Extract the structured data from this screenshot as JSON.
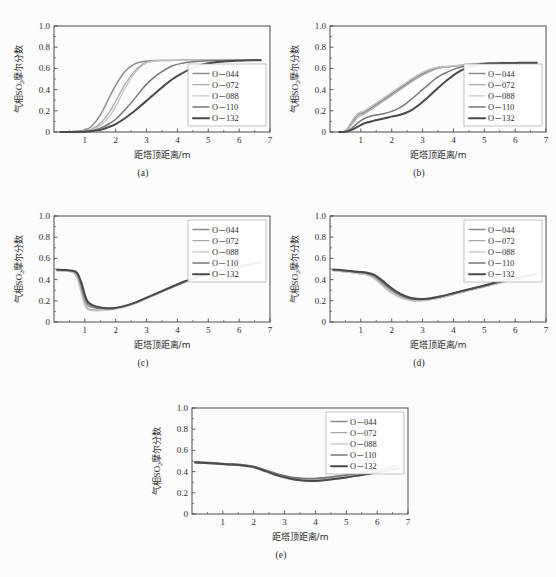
{
  "figure": {
    "background": "#fcfcfc",
    "axis_color": "#3a3a3a",
    "panels_count": 5
  },
  "axis": {
    "xlabel": "距塔顶距离/m",
    "ylabel_cjk_head": "气相",
    "ylabel_so2": "SO",
    "ylabel_sub": "2",
    "ylabel_cjk_tail": "摩尔分数",
    "ylabel_full": "气相SO2摩尔分数",
    "xticks": [
      "1",
      "2",
      "3",
      "4",
      "5",
      "6",
      "7"
    ],
    "yticks": [
      "0",
      "0.2",
      "0.4",
      "0.6",
      "0.8",
      "1.0"
    ],
    "xlim": [
      0,
      7
    ],
    "ylim": [
      0,
      1
    ]
  },
  "legend": {
    "entries": [
      {
        "label": "O－044",
        "color": "#8c8c8c",
        "width": 1.5
      },
      {
        "label": "O－072",
        "color": "#a8a8a8",
        "width": 1.3
      },
      {
        "label": "O－088",
        "color": "#c4c4c4",
        "width": 1.3
      },
      {
        "label": "O－110",
        "color": "#787878",
        "width": 1.5
      },
      {
        "label": "O－132",
        "color": "#4a4a4a",
        "width": 2.0
      }
    ]
  },
  "panels": [
    {
      "id": "a",
      "caption": "(a)",
      "legend_position": "bottom-right"
    },
    {
      "id": "b",
      "caption": "(b)",
      "legend_position": "bottom-right"
    },
    {
      "id": "c",
      "caption": "(c)",
      "legend_position": "top-right"
    },
    {
      "id": "d",
      "caption": "(d)",
      "legend_position": "top-right"
    },
    {
      "id": "e",
      "caption": "(e)",
      "legend_position": "top-right"
    }
  ],
  "chart_data": [
    {
      "type": "line",
      "panel": "a",
      "title": "(a)",
      "xlabel": "距塔顶距离/m",
      "ylabel": "气相SO2摩尔分数",
      "xlim": [
        0,
        7
      ],
      "ylim": [
        0,
        1
      ],
      "grid": false,
      "legend_position": "bottom-right",
      "x": [
        0.2,
        0.5,
        0.8,
        1.0,
        1.2,
        1.5,
        1.8,
        2.0,
        2.3,
        2.6,
        2.9,
        3.1,
        3.3,
        3.5,
        3.8,
        4.1,
        4.5,
        5.0,
        5.5,
        6.0,
        6.4,
        6.7
      ],
      "series": [
        {
          "name": "O－044",
          "values": [
            0.0,
            0.0,
            0.01,
            0.02,
            0.05,
            0.16,
            0.33,
            0.44,
            0.57,
            0.64,
            0.665,
            0.67,
            0.675,
            0.675,
            0.675,
            0.678,
            0.678,
            0.678,
            0.678,
            0.678,
            0.678,
            0.678
          ]
        },
        {
          "name": "O－072",
          "values": [
            0.0,
            0.0,
            0.005,
            0.01,
            0.025,
            0.08,
            0.19,
            0.29,
            0.45,
            0.57,
            0.645,
            0.665,
            0.672,
            0.675,
            0.675,
            0.676,
            0.677,
            0.678,
            0.678,
            0.678,
            0.678,
            0.678
          ]
        },
        {
          "name": "O－088",
          "values": [
            0.0,
            0.0,
            0.004,
            0.008,
            0.02,
            0.06,
            0.15,
            0.24,
            0.41,
            0.55,
            0.635,
            0.66,
            0.671,
            0.675,
            0.675,
            0.676,
            0.677,
            0.678,
            0.678,
            0.678,
            0.678,
            0.678
          ]
        },
        {
          "name": "O－110",
          "values": [
            0.0,
            0.0,
            0.002,
            0.005,
            0.012,
            0.035,
            0.08,
            0.12,
            0.21,
            0.31,
            0.42,
            0.48,
            0.53,
            0.57,
            0.62,
            0.645,
            0.662,
            0.672,
            0.675,
            0.677,
            0.678,
            0.678
          ]
        },
        {
          "name": "O－132",
          "values": [
            0.0,
            0.0,
            0.001,
            0.003,
            0.008,
            0.02,
            0.05,
            0.075,
            0.13,
            0.195,
            0.27,
            0.32,
            0.37,
            0.42,
            0.49,
            0.545,
            0.605,
            0.648,
            0.665,
            0.673,
            0.677,
            0.678
          ]
        }
      ]
    },
    {
      "type": "line",
      "panel": "b",
      "title": "(b)",
      "xlabel": "距塔顶距离/m",
      "ylabel": "气相SO2摩尔分数",
      "xlim": [
        0,
        7
      ],
      "ylim": [
        0,
        1
      ],
      "grid": false,
      "legend_position": "bottom-right",
      "x": [
        0.3,
        0.5,
        0.7,
        0.9,
        1.1,
        1.4,
        1.7,
        2.0,
        2.3,
        2.6,
        2.9,
        3.2,
        3.5,
        3.8,
        4.1,
        4.4,
        4.8,
        5.2,
        5.6,
        6.0,
        6.4,
        6.7
      ],
      "series": [
        {
          "name": "O－044",
          "values": [
            0.0,
            0.01,
            0.09,
            0.16,
            0.185,
            0.24,
            0.3,
            0.36,
            0.42,
            0.48,
            0.535,
            0.575,
            0.605,
            0.615,
            0.625,
            0.635,
            0.645,
            0.65,
            0.652,
            0.653,
            0.653,
            0.653
          ]
        },
        {
          "name": "O－072",
          "values": [
            0.0,
            0.008,
            0.07,
            0.14,
            0.17,
            0.225,
            0.285,
            0.345,
            0.405,
            0.465,
            0.52,
            0.565,
            0.6,
            0.613,
            0.623,
            0.633,
            0.644,
            0.649,
            0.651,
            0.652,
            0.653,
            0.653
          ]
        },
        {
          "name": "O－088",
          "values": [
            0.0,
            0.012,
            0.1,
            0.175,
            0.2,
            0.255,
            0.315,
            0.375,
            0.435,
            0.495,
            0.55,
            0.59,
            0.615,
            0.62,
            0.628,
            0.637,
            0.646,
            0.65,
            0.652,
            0.653,
            0.653,
            0.653
          ]
        },
        {
          "name": "O－110",
          "values": [
            0.0,
            0.004,
            0.035,
            0.085,
            0.125,
            0.155,
            0.17,
            0.195,
            0.235,
            0.3,
            0.375,
            0.45,
            0.52,
            0.565,
            0.6,
            0.622,
            0.64,
            0.648,
            0.651,
            0.652,
            0.653,
            0.653
          ]
        },
        {
          "name": "O－132",
          "values": [
            0.0,
            0.002,
            0.02,
            0.05,
            0.08,
            0.105,
            0.125,
            0.145,
            0.165,
            0.2,
            0.26,
            0.335,
            0.415,
            0.49,
            0.555,
            0.6,
            0.635,
            0.646,
            0.65,
            0.652,
            0.653,
            0.653
          ]
        }
      ]
    },
    {
      "type": "line",
      "panel": "c",
      "title": "(c)",
      "xlabel": "距塔顶距离/m",
      "ylabel": "气相SO2摩尔分数",
      "xlim": [
        0,
        7
      ],
      "ylim": [
        0,
        1
      ],
      "grid": false,
      "legend_position": "top-right",
      "x": [
        0.1,
        0.4,
        0.6,
        0.75,
        0.9,
        1.0,
        1.1,
        1.3,
        1.6,
        1.9,
        2.2,
        2.6,
        3.0,
        3.4,
        3.8,
        4.2,
        4.6,
        5.0,
        5.3,
        5.7,
        6.1,
        6.5,
        6.7
      ],
      "series": [
        {
          "name": "O－044",
          "values": [
            0.49,
            0.485,
            0.475,
            0.44,
            0.3,
            0.2,
            0.155,
            0.135,
            0.125,
            0.125,
            0.14,
            0.175,
            0.225,
            0.275,
            0.325,
            0.375,
            0.415,
            0.455,
            0.475,
            0.5,
            0.525,
            0.55,
            0.56
          ]
        },
        {
          "name": "O－072",
          "values": [
            0.485,
            0.48,
            0.47,
            0.425,
            0.275,
            0.175,
            0.13,
            0.115,
            0.115,
            0.12,
            0.138,
            0.172,
            0.222,
            0.272,
            0.322,
            0.372,
            0.412,
            0.452,
            0.472,
            0.497,
            0.522,
            0.547,
            0.557
          ]
        },
        {
          "name": "O－088",
          "values": [
            0.48,
            0.478,
            0.468,
            0.415,
            0.25,
            0.155,
            0.115,
            0.105,
            0.11,
            0.118,
            0.136,
            0.17,
            0.22,
            0.27,
            0.32,
            0.37,
            0.41,
            0.45,
            0.47,
            0.495,
            0.52,
            0.545,
            0.555
          ]
        },
        {
          "name": "O－110",
          "values": [
            0.492,
            0.488,
            0.48,
            0.455,
            0.335,
            0.235,
            0.175,
            0.145,
            0.13,
            0.128,
            0.143,
            0.178,
            0.228,
            0.278,
            0.328,
            0.378,
            0.418,
            0.458,
            0.478,
            0.503,
            0.528,
            0.552,
            0.562
          ]
        },
        {
          "name": "O－132",
          "values": [
            0.495,
            0.49,
            0.483,
            0.465,
            0.36,
            0.255,
            0.19,
            0.152,
            0.133,
            0.13,
            0.145,
            0.18,
            0.23,
            0.28,
            0.33,
            0.38,
            0.42,
            0.46,
            0.48,
            0.505,
            0.53,
            0.555,
            0.565
          ]
        }
      ]
    },
    {
      "type": "line",
      "panel": "d",
      "title": "(d)",
      "xlabel": "距塔顶距离/m",
      "ylabel": "气相SO2摩尔分数",
      "xlim": [
        0,
        7
      ],
      "ylim": [
        0,
        1
      ],
      "grid": false,
      "legend_position": "top-right",
      "x": [
        0.1,
        0.5,
        0.9,
        1.2,
        1.45,
        1.7,
        2.0,
        2.3,
        2.6,
        2.9,
        3.2,
        3.6,
        4.0,
        4.4,
        4.8,
        5.2,
        5.6,
        6.0,
        6.3,
        6.5,
        6.7
      ],
      "series": [
        {
          "name": "O－044",
          "values": [
            0.49,
            0.478,
            0.465,
            0.455,
            0.425,
            0.365,
            0.295,
            0.245,
            0.215,
            0.208,
            0.215,
            0.238,
            0.268,
            0.298,
            0.325,
            0.355,
            0.385,
            0.412,
            0.43,
            0.443,
            0.455
          ]
        },
        {
          "name": "O－072",
          "values": [
            0.485,
            0.473,
            0.46,
            0.448,
            0.413,
            0.348,
            0.278,
            0.232,
            0.205,
            0.2,
            0.208,
            0.23,
            0.26,
            0.29,
            0.318,
            0.348,
            0.378,
            0.405,
            0.423,
            0.437,
            0.448
          ]
        },
        {
          "name": "O－088",
          "values": [
            0.482,
            0.47,
            0.457,
            0.443,
            0.405,
            0.34,
            0.272,
            0.228,
            0.203,
            0.198,
            0.206,
            0.228,
            0.257,
            0.287,
            0.314,
            0.344,
            0.373,
            0.4,
            0.418,
            0.43,
            0.442
          ]
        },
        {
          "name": "O－110",
          "values": [
            0.493,
            0.482,
            0.47,
            0.46,
            0.435,
            0.378,
            0.308,
            0.255,
            0.222,
            0.212,
            0.218,
            0.24,
            0.27,
            0.3,
            0.327,
            0.357,
            0.386,
            0.412,
            0.428,
            0.438,
            0.448
          ]
        },
        {
          "name": "O－132",
          "values": [
            0.496,
            0.486,
            0.474,
            0.465,
            0.443,
            0.39,
            0.318,
            0.262,
            0.228,
            0.216,
            0.222,
            0.243,
            0.272,
            0.302,
            0.33,
            0.36,
            0.39,
            0.416,
            0.432,
            0.442,
            0.452
          ]
        }
      ]
    },
    {
      "type": "line",
      "panel": "e",
      "title": "(e)",
      "xlabel": "距塔顶距离/m",
      "ylabel": "气相SO2摩尔分数",
      "xlim": [
        0,
        7
      ],
      "ylim": [
        0,
        1
      ],
      "grid": false,
      "legend_position": "top-right",
      "x": [
        0.1,
        0.6,
        1.1,
        1.6,
        2.0,
        2.4,
        2.8,
        3.2,
        3.6,
        3.9,
        4.2,
        4.6,
        5.0,
        5.4,
        5.8,
        6.2,
        6.5,
        6.7
      ],
      "series": [
        {
          "name": "O－044",
          "values": [
            0.49,
            0.482,
            0.472,
            0.463,
            0.447,
            0.41,
            0.372,
            0.345,
            0.332,
            0.33,
            0.336,
            0.35,
            0.365,
            0.385,
            0.405,
            0.428,
            0.445,
            0.458
          ]
        },
        {
          "name": "O－072",
          "values": [
            0.485,
            0.477,
            0.467,
            0.458,
            0.44,
            0.4,
            0.36,
            0.332,
            0.318,
            0.315,
            0.32,
            0.334,
            0.35,
            0.37,
            0.39,
            0.412,
            0.428,
            0.44
          ]
        },
        {
          "name": "O－088",
          "values": [
            0.482,
            0.474,
            0.464,
            0.455,
            0.436,
            0.395,
            0.354,
            0.325,
            0.31,
            0.307,
            0.313,
            0.327,
            0.343,
            0.363,
            0.383,
            0.405,
            0.42,
            0.432
          ]
        },
        {
          "name": "O－110",
          "values": [
            0.493,
            0.485,
            0.475,
            0.466,
            0.45,
            0.413,
            0.376,
            0.35,
            0.337,
            0.335,
            0.341,
            0.354,
            0.369,
            0.389,
            0.409,
            0.431,
            0.447,
            0.46
          ]
        },
        {
          "name": "O－132",
          "values": [
            0.487,
            0.479,
            0.469,
            0.46,
            0.442,
            0.402,
            0.362,
            0.333,
            0.317,
            0.312,
            0.317,
            0.33,
            0.345,
            0.364,
            0.383,
            0.404,
            0.419,
            0.43
          ]
        }
      ]
    }
  ]
}
